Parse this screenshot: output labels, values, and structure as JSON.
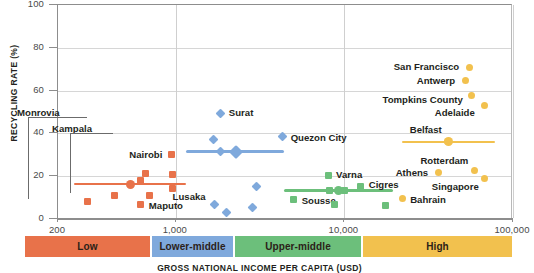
{
  "chart_data": {
    "type": "scatter",
    "title": "",
    "xlabel": "GROSS NATIONAL INCOME PER CAPITA (USD)",
    "ylabel": "RECYCLING RATE (%)",
    "x_scale": "log",
    "xlim": [
      200,
      100000
    ],
    "ylim": [
      0,
      100
    ],
    "grid": true,
    "legend_position": "below-axis-bands",
    "y_ticks": [
      "0",
      "20",
      "40",
      "60",
      "80",
      "100"
    ],
    "y_tick_values": [
      0,
      20,
      40,
      60,
      80,
      100
    ],
    "x_ticks": [
      "200",
      "1,000",
      "10,000",
      "100,000"
    ],
    "x_tick_values": [
      200,
      1000,
      10000,
      100000
    ],
    "series": [
      {
        "name": "Low",
        "color": "#E8724A",
        "marker": "square",
        "trend": {
          "x_start": 250,
          "x_end": 1150,
          "y": 16.3
        },
        "points": [
          {
            "x": 300,
            "y": 8.2,
            "label": "Monrovia"
          },
          {
            "x": 430,
            "y": 11.0,
            "label": "Kampala"
          },
          {
            "x": 620,
            "y": 18.0,
            "label": ""
          },
          {
            "x": 660,
            "y": 21.2,
            "label": ""
          },
          {
            "x": 700,
            "y": 11.0,
            "label": ""
          },
          {
            "x": 620,
            "y": 6.6,
            "label": "Maputo"
          },
          {
            "x": 940,
            "y": 30.0,
            "label": "Nairobi"
          },
          {
            "x": 960,
            "y": 20.6,
            "label": ""
          },
          {
            "x": 950,
            "y": 14.4,
            "label": ""
          }
        ]
      },
      {
        "name": "Lower-middle",
        "color": "#7FA9DC",
        "marker": "diamond",
        "trend": {
          "x_start": 1150,
          "x_end": 4400,
          "y": 31.5
        },
        "points": [
          {
            "x": 1850,
            "y": 49.5,
            "label": "Surat"
          },
          {
            "x": 1680,
            "y": 37.0,
            "label": ""
          },
          {
            "x": 1850,
            "y": 31.5,
            "label": ""
          },
          {
            "x": 4300,
            "y": 38.5,
            "label": "Quezon City"
          },
          {
            "x": 3000,
            "y": 15.0,
            "label": ""
          },
          {
            "x": 1700,
            "y": 6.6,
            "label": "Lusaka"
          },
          {
            "x": 2000,
            "y": 3.2,
            "label": ""
          },
          {
            "x": 2850,
            "y": 5.2,
            "label": ""
          }
        ]
      },
      {
        "name": "Upper-middle",
        "color": "#6CBF7B",
        "marker": "square",
        "trend": {
          "x_start": 4400,
          "x_end": 19500,
          "y": 13.2
        },
        "points": [
          {
            "x": 8000,
            "y": 20.3,
            "label": "Varna"
          },
          {
            "x": 8200,
            "y": 13.5,
            "label": ""
          },
          {
            "x": 10000,
            "y": 13.2,
            "label": ""
          },
          {
            "x": 12500,
            "y": 15.3,
            "label": "Cigres"
          },
          {
            "x": 5000,
            "y": 9.0,
            "label": "Sousse"
          },
          {
            "x": 8700,
            "y": 6.6,
            "label": ""
          },
          {
            "x": 17500,
            "y": 6.2,
            "label": ""
          }
        ]
      },
      {
        "name": "High",
        "color": "#F2C14E",
        "marker": "circle",
        "trend": {
          "x_start": 22000,
          "x_end": 78000,
          "y": 36.0
        },
        "points": [
          {
            "x": 55000,
            "y": 71.0,
            "label": "San Francisco"
          },
          {
            "x": 52000,
            "y": 64.5,
            "label": "Antwerp"
          },
          {
            "x": 57000,
            "y": 57.5,
            "label": "Tompkins County"
          },
          {
            "x": 68000,
            "y": 53.0,
            "label": "Adelaide"
          },
          {
            "x": 41000,
            "y": 36.0,
            "label": "Belfast"
          },
          {
            "x": 36000,
            "y": 21.5,
            "label": "Athens"
          },
          {
            "x": 59000,
            "y": 22.5,
            "label": "Rotterdam"
          },
          {
            "x": 68000,
            "y": 19.0,
            "label": "Singapore"
          },
          {
            "x": 22000,
            "y": 9.5,
            "label": "Bahrain"
          }
        ]
      }
    ],
    "income_bands": [
      {
        "label": "Low",
        "color": "#E8724A"
      },
      {
        "label": "Lower-middle",
        "color": "#7FA9DC"
      },
      {
        "label": "Upper-middle",
        "color": "#6CBF7B"
      },
      {
        "label": "High",
        "color": "#F2C14E"
      }
    ]
  }
}
